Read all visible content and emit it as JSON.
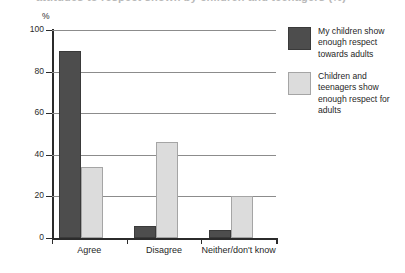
{
  "figure": {
    "clipped_title": "attitudes to respect shown by children and teenagers (%)",
    "y_unit_label": "%"
  },
  "legend": {
    "position": "right",
    "entries": [
      {
        "swatch": "dark-swatch",
        "label": "My children show enough respect towards adults",
        "color": "#4d4d4d"
      },
      {
        "swatch": "light-swatch",
        "label": "Children and teenagers show enough respect for adults",
        "color": "#dcdcdc"
      }
    ]
  },
  "chart_data": {
    "type": "bar",
    "title": "",
    "xlabel": "",
    "ylabel": "%",
    "ylim": [
      0,
      100
    ],
    "yticks": [
      0,
      20,
      40,
      60,
      80,
      100
    ],
    "ytick_labels": [
      "0",
      "20",
      "40",
      "60",
      "80",
      "100"
    ],
    "grid": true,
    "legend_position": "right",
    "categories": [
      "Agree",
      "Disagree",
      "Neither/don't know"
    ],
    "series": [
      {
        "name": "My children show enough respect towards adults",
        "color": "#4d4d4d",
        "values": [
          90,
          6,
          4
        ]
      },
      {
        "name": "Children and teenagers show enough respect for adults",
        "color": "#dcdcdc",
        "values": [
          34,
          46,
          20
        ]
      }
    ]
  }
}
